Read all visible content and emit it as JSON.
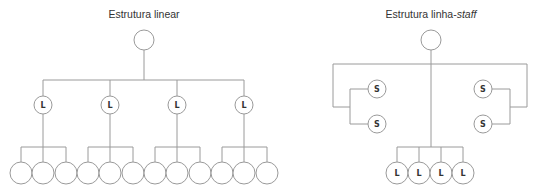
{
  "diagrams": [
    {
      "id": "linear",
      "title": "Estrutura linear",
      "top_node": {
        "x": 144,
        "y": 40,
        "r": 10,
        "label": ""
      },
      "bus_y": 80,
      "line_nodes": [
        {
          "x": 43,
          "y": 105,
          "label": "L"
        },
        {
          "x": 110,
          "y": 105,
          "label": "L"
        },
        {
          "x": 177,
          "y": 105,
          "label": "L"
        },
        {
          "x": 244,
          "y": 105,
          "label": "L"
        }
      ],
      "branch_y": 147,
      "leaf_groups": [
        {
          "xs": [
            21,
            43,
            66
          ]
        },
        {
          "xs": [
            88,
            110,
            133
          ]
        },
        {
          "xs": [
            155,
            177,
            200
          ]
        },
        {
          "xs": [
            222,
            244,
            267
          ]
        }
      ],
      "leaf_y": 173
    },
    {
      "id": "line-staff",
      "title_main": "Estrutura linha-",
      "title_italic": "staff",
      "top_node": {
        "x": 431,
        "y": 40,
        "r": 10,
        "label": ""
      },
      "frame_y": 64,
      "frame_left_x": 333,
      "frame_right_x": 527,
      "staff_left": {
        "bracket_x": 350,
        "join_y": 107,
        "nodes": [
          {
            "x": 377,
            "y": 89,
            "label": "S"
          },
          {
            "x": 377,
            "y": 124,
            "label": "S"
          }
        ]
      },
      "staff_right": {
        "bracket_x": 510,
        "join_y": 107,
        "nodes": [
          {
            "x": 483,
            "y": 89,
            "label": "S"
          },
          {
            "x": 483,
            "y": 124,
            "label": "S"
          }
        ]
      },
      "branch_y": 147,
      "line_nodes": [
        {
          "x": 397,
          "y": 173,
          "label": "L"
        },
        {
          "x": 419,
          "y": 173,
          "label": "L"
        },
        {
          "x": 441,
          "y": 173,
          "label": "L"
        },
        {
          "x": 463,
          "y": 173,
          "label": "L"
        }
      ]
    }
  ],
  "colors": {
    "stroke": "#9a9a9a",
    "text": "#333333"
  }
}
